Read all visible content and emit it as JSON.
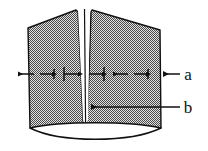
{
  "figure": {
    "type": "technical-cross-section-diagram",
    "title": "",
    "background_color": "#ffffff",
    "outline_color": "#111111",
    "hatch_color": "#5a5a5a",
    "hatch_background": "#d8d8d8",
    "labels": [
      {
        "id": "a",
        "text": "a",
        "x": 190,
        "y": 80,
        "leader_from_x": 182,
        "leader_to_x": 140,
        "leader_y": 74,
        "arrow_direction": "left",
        "points_to": "outer-right-edge-of-specimen"
      },
      {
        "id": "b",
        "text": "b",
        "x": 190,
        "y": 113,
        "leader_from_x": 182,
        "leader_to_x": 95,
        "leader_y": 107,
        "arrow_direction": "left",
        "points_to": "central-narrow-gap"
      }
    ],
    "dimension_arrows": {
      "row_y": 74,
      "segments": [
        {
          "name": "left-outer-span",
          "from_x": 18,
          "to_x": 52,
          "style": "double-arrow-outward"
        },
        {
          "name": "left-gap-edge",
          "from_x": 60,
          "to_x": 80,
          "style": "arrow-with-tick"
        },
        {
          "name": "right-gap-edge",
          "from_x": 86,
          "to_x": 106,
          "style": "arrow-with-tick"
        },
        {
          "name": "right-outer-span",
          "from_x": 114,
          "to_x": 148,
          "style": "double-arrow-outward"
        }
      ]
    },
    "geometry": {
      "left_block": {
        "top_left_x": 28,
        "top_left_y": 28,
        "top_right_x": 76,
        "top_right_y": 10,
        "bottom_y": 128
      },
      "right_block": {
        "top_left_x": 92,
        "top_left_y": 10,
        "top_right_x": 160,
        "top_right_y": 30,
        "bottom_y": 128
      },
      "gap": {
        "top_width": 16,
        "bottom_width": 3,
        "center_x": 84,
        "shape": "wedge-narrowing-downward",
        "center_line": true
      },
      "base_ellipse": {
        "center_x": 95,
        "center_y": 131,
        "rx": 70,
        "ry": 10,
        "note": "curved lens-shaped base formed by two elliptical arcs"
      }
    }
  }
}
